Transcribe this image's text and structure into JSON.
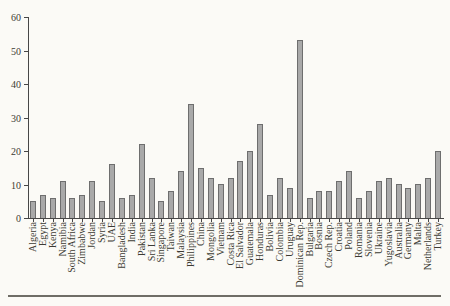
{
  "page": {
    "background": "#fbfaf6"
  },
  "chart_data": {
    "type": "bar",
    "title": "",
    "xlabel": "",
    "ylabel": "",
    "ylim": [
      0,
      60
    ],
    "yticks": [
      0,
      10,
      20,
      30,
      40,
      50,
      60
    ],
    "grid": false,
    "legend": "none",
    "bar_fill_color": "#a9a9a9",
    "bar_border_color": "#6e6e6e",
    "axis_color": "#474747",
    "text_color": "#3c3a33",
    "categories": [
      "Algeria",
      "Egypt",
      "Kenya",
      "Namibia",
      "South Africa",
      "Zimbabwe",
      "Jordan",
      "Syria",
      "UAE",
      "Bangladesh",
      "India",
      "Pakistan",
      "Sri Lanka",
      "Singapore",
      "Taiwan",
      "Malaysia",
      "Philippines",
      "China",
      "Mongolia",
      "Vietnam",
      "Costa Rica",
      "El Salvador",
      "Guatemala",
      "Honduras",
      "Bolivia",
      "Colombia",
      "Uruguay",
      "Dominican Rep.",
      "Bulgaria",
      "Bosnia",
      "Czech Rep.",
      "Croatia",
      "Poland",
      "Romania",
      "Slovenia",
      "Ukraine",
      "Yugoslavia",
      "Australia",
      "Germany",
      "Malta",
      "Netherlands",
      "Turkey"
    ],
    "values": [
      5,
      7,
      6,
      11,
      6,
      7,
      11,
      5,
      16,
      6,
      7,
      22,
      12,
      5,
      8,
      14,
      34,
      15,
      12,
      10,
      12,
      17,
      20,
      28,
      7,
      12,
      9,
      53,
      6,
      8,
      8,
      11,
      14,
      6,
      8,
      11,
      12,
      10,
      9,
      10,
      12,
      20
    ]
  },
  "footer": {
    "rule_color": "#6f6d66"
  }
}
